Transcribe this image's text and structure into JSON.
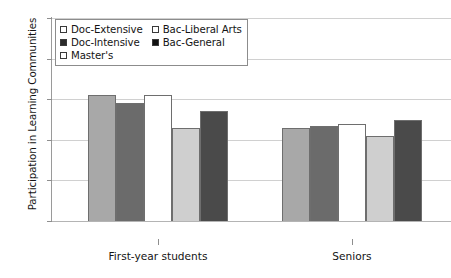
{
  "chart_data": {
    "type": "bar",
    "title": "",
    "xlabel": "",
    "ylabel": "Participation in Learning Communities",
    "categories": [
      "First-year students",
      "Seniors"
    ],
    "ylim": [
      0,
      50
    ],
    "yticks": [
      0,
      10,
      20,
      30,
      40,
      50
    ],
    "ytick_labels": [
      "0",
      "10",
      "20",
      "30",
      "40",
      "50"
    ],
    "grid": true,
    "legend_position": "top-left",
    "series": [
      {
        "name": "Doc-Extensive",
        "values": [
          31,
          23
        ],
        "color": "#a8a8a8"
      },
      {
        "name": "Doc-Intensive",
        "values": [
          29,
          23.5
        ],
        "color": "#6b6b6b"
      },
      {
        "name": "Master's",
        "values": [
          31,
          24
        ],
        "color": "#ffffff"
      },
      {
        "name": "Bac-Liberal Arts",
        "values": [
          23,
          21
        ],
        "color": "#cfcfcf"
      },
      {
        "name": "Bac-General",
        "values": [
          27,
          25
        ],
        "color": "#4a4a4a"
      }
    ]
  },
  "legend": {
    "entries": [
      {
        "label": "Doc-Extensive",
        "swatch": "#ffffff"
      },
      {
        "label": "Bac-Liberal Arts",
        "swatch": "#ffffff"
      },
      {
        "label": "Doc-Intensive",
        "swatch": "#2b2b2b"
      },
      {
        "label": "Bac-General",
        "swatch": "#111111"
      },
      {
        "label": "Master's",
        "swatch": "#ffffff"
      }
    ]
  }
}
